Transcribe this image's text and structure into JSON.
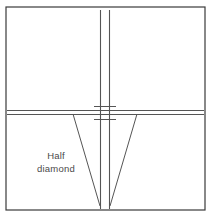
{
  "figure": {
    "name": "half-diamond-crossing-diagram",
    "background_color": "#ffffff",
    "line_color": "#555555",
    "border_color": "#3a3a3a",
    "text_color": "#4a4a4a",
    "width": 212,
    "height": 217
  },
  "frame": {
    "label": "diagram-border",
    "x": 6,
    "y": 7,
    "width": 199,
    "height": 203,
    "stroke_width": 1.2
  },
  "label": {
    "line1": "Half",
    "line2": "diamond",
    "x": 56,
    "y1": 159,
    "y2": 172,
    "font_size": 9.5
  },
  "vertical_track": {
    "name": "vertical-double-line",
    "rail_left_x": 100.5,
    "rail_right_x": 109.5,
    "top_y": 10,
    "bottom_y": 209,
    "stroke_width": 1.1
  },
  "horizontal_track": {
    "name": "horizontal-double-line",
    "rail_top_y": 110.5,
    "rail_bottom_y": 114.5,
    "left_x": 7,
    "right_x": 204,
    "stroke_width": 1.1
  },
  "crossing_ticks": {
    "name": "crossing-flange-marks",
    "upper_y": 106.5,
    "lower_y": 119.5,
    "left_x": 94,
    "right_x": 116,
    "stroke_width": 1.0
  },
  "diagonals": [
    {
      "name": "left-diagonal-rail",
      "x1": 73,
      "y1": 114,
      "x2": 100,
      "y2": 206
    },
    {
      "name": "right-diagonal-rail",
      "x1": 137,
      "y1": 114,
      "x2": 110,
      "y2": 206
    }
  ]
}
